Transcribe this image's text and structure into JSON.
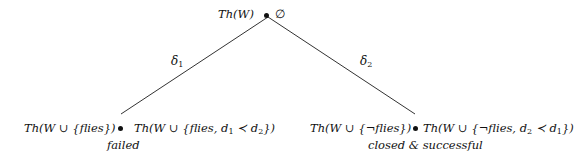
{
  "diagram": {
    "root": {
      "theory": "Th(W)",
      "set": "∅"
    },
    "edges": [
      {
        "label": "δ",
        "sub": "1",
        "from": "root",
        "to": "left"
      },
      {
        "label": "δ",
        "sub": "2",
        "from": "root",
        "to": "right"
      }
    ],
    "left": {
      "theory": "Th(W ∪ {flies})",
      "set_prefix": "Th(W ∪ {flies, d",
      "set_sub1": "1",
      "set_mid": " ≺ d",
      "set_sub2": "2",
      "set_suffix": "})",
      "status": "failed"
    },
    "right": {
      "theory": "Th(W ∪ {¬flies})",
      "set_prefix": "Th(W ∪ {¬flies, d",
      "set_sub1": "2",
      "set_mid": " ≺ d",
      "set_sub2": "1",
      "set_suffix": "})",
      "status": "closed & successful"
    },
    "colors": {
      "ink": "#111111",
      "line": "#333333"
    }
  }
}
